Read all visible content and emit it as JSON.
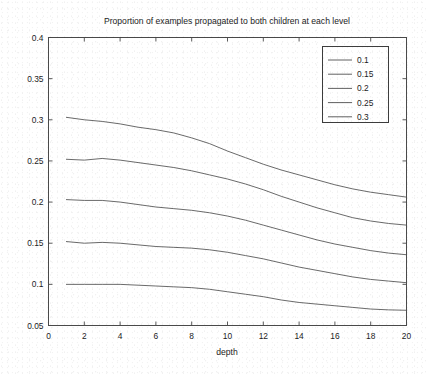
{
  "chart_data": {
    "type": "line",
    "title": "Proportion of examples propagated to both children at each level",
    "xlabel": "depth",
    "ylabel": "",
    "xlim": [
      0,
      20
    ],
    "ylim": [
      0.05,
      0.4
    ],
    "xticks": [
      0,
      2,
      4,
      6,
      8,
      10,
      12,
      14,
      16,
      18,
      20
    ],
    "xtick_labels": [
      "0",
      "2",
      "4",
      "6",
      "8",
      "10",
      "12",
      "14",
      "16",
      "18",
      "20"
    ],
    "yticks": [
      0.05,
      0.1,
      0.15,
      0.2,
      0.25,
      0.3,
      0.35,
      0.4
    ],
    "ytick_labels": [
      "0.05",
      "0.1",
      "0.15",
      "0.2",
      "0.25",
      "0.3",
      "0.35",
      "0.4"
    ],
    "grid": false,
    "legend_position": "upper right",
    "legend_title": "",
    "x": [
      1,
      2,
      3,
      4,
      5,
      6,
      7,
      8,
      9,
      10,
      11,
      12,
      13,
      14,
      15,
      16,
      17,
      18,
      19,
      20
    ],
    "series": [
      {
        "name": "0.3",
        "label": "0.3",
        "color": "#4f4f4f",
        "values": [
          0.303,
          0.3,
          0.298,
          0.295,
          0.291,
          0.288,
          0.284,
          0.278,
          0.271,
          0.262,
          0.254,
          0.246,
          0.239,
          0.233,
          0.227,
          0.221,
          0.216,
          0.212,
          0.209,
          0.206
        ]
      },
      {
        "name": "0.25",
        "label": "0.25",
        "color": "#4f4f4f",
        "values": [
          0.252,
          0.251,
          0.253,
          0.251,
          0.248,
          0.245,
          0.242,
          0.238,
          0.233,
          0.228,
          0.222,
          0.215,
          0.207,
          0.2,
          0.193,
          0.187,
          0.181,
          0.177,
          0.174,
          0.172
        ]
      },
      {
        "name": "0.2",
        "label": "0.2",
        "color": "#4f4f4f",
        "values": [
          0.203,
          0.202,
          0.202,
          0.2,
          0.197,
          0.194,
          0.192,
          0.19,
          0.187,
          0.183,
          0.178,
          0.172,
          0.166,
          0.16,
          0.154,
          0.149,
          0.145,
          0.141,
          0.138,
          0.136
        ]
      },
      {
        "name": "0.15",
        "label": "0.15",
        "color": "#4f4f4f",
        "values": [
          0.152,
          0.15,
          0.151,
          0.15,
          0.148,
          0.146,
          0.145,
          0.144,
          0.142,
          0.139,
          0.135,
          0.131,
          0.126,
          0.121,
          0.117,
          0.113,
          0.109,
          0.106,
          0.104,
          0.102
        ]
      },
      {
        "name": "0.1",
        "label": "0.1",
        "color": "#4f4f4f",
        "values": [
          0.1,
          0.1,
          0.1,
          0.1,
          0.099,
          0.098,
          0.097,
          0.096,
          0.094,
          0.091,
          0.088,
          0.085,
          0.081,
          0.078,
          0.076,
          0.074,
          0.072,
          0.07,
          0.069,
          0.0685
        ]
      }
    ],
    "legend_entries": [
      "0.1",
      "0.15",
      "0.2",
      "0.25",
      "0.3"
    ]
  }
}
